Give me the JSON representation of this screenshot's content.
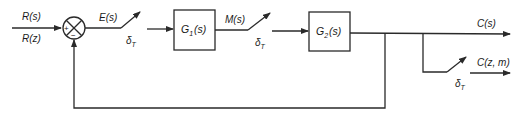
{
  "diagram": {
    "type": "sampled-data feedback control block diagram",
    "inputs": {
      "top_label": "R(s)",
      "bottom_label": "R(z)"
    },
    "summing_junction": {
      "plus_sign": "+",
      "minus_sign": "−"
    },
    "signals": {
      "error": "E(s)",
      "manipulated": "M(s)",
      "output": "C(s)",
      "sampled_output": "C(z, m)"
    },
    "samplers": [
      {
        "label": "δ",
        "subscript": "T"
      },
      {
        "label": "δ",
        "subscript": "T"
      },
      {
        "label": "δ",
        "subscript": "T"
      }
    ],
    "blocks": [
      {
        "name": "G",
        "subscript": "1",
        "arg": "(s)"
      },
      {
        "name": "G",
        "subscript": "2",
        "arg": "(s)"
      }
    ],
    "colors": {
      "line": "#2a2a2a",
      "text": "#1a1a1a",
      "background": "#ffffff"
    }
  }
}
